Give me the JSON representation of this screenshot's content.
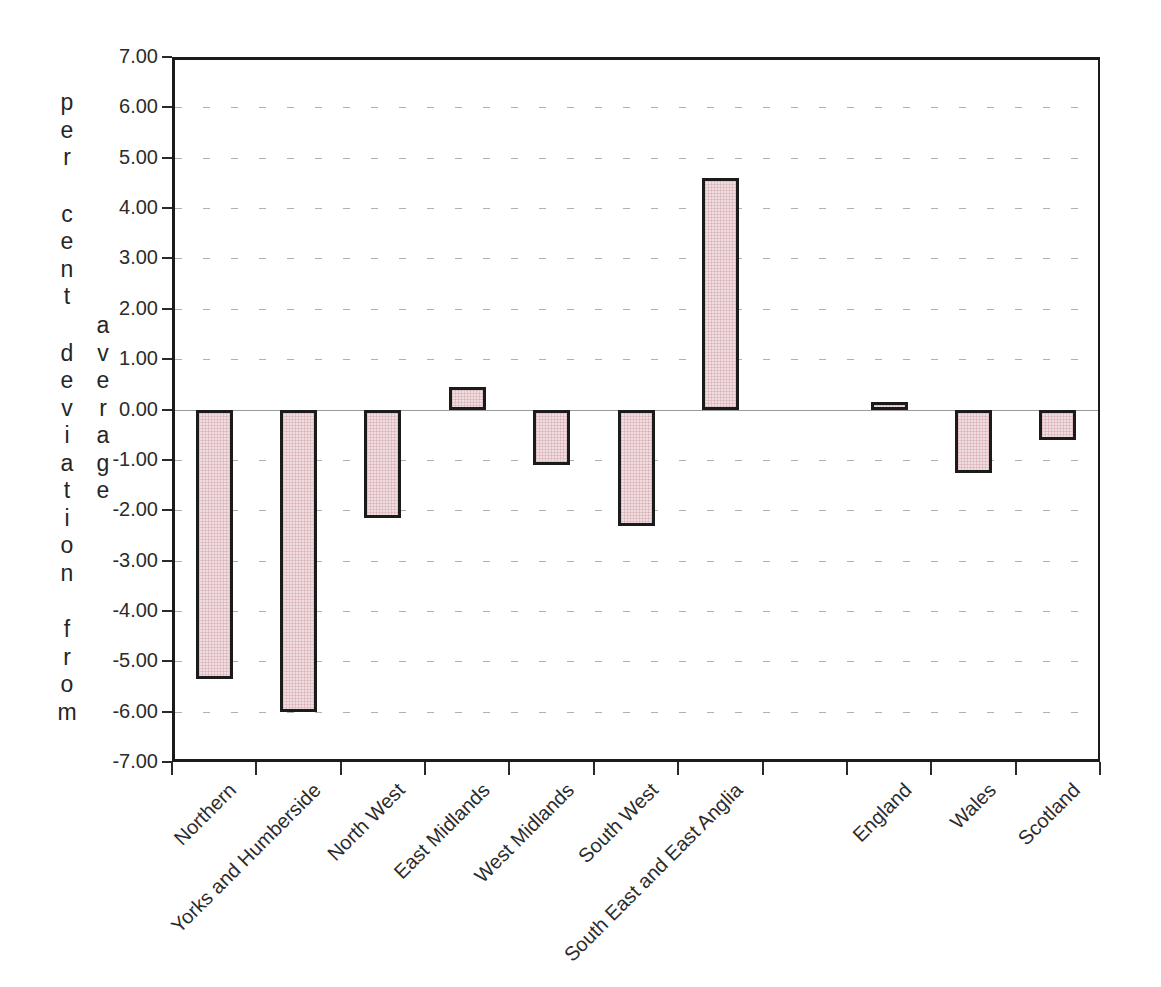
{
  "chart_data": {
    "type": "bar",
    "title": "",
    "y_axis_title": "per cent deviation from",
    "y_axis_title_2": "average",
    "categories": [
      "Northern",
      "Yorks and Humberside",
      "North West",
      "East Midlands",
      "West Midlands",
      "South West",
      "South East and East Anglia",
      "",
      "England",
      "Wales",
      "Scotland"
    ],
    "values": [
      -5.35,
      -6.0,
      -2.15,
      0.45,
      -1.1,
      -2.3,
      4.6,
      null,
      0.15,
      -1.25,
      -0.6
    ],
    "ylim": [
      -7,
      7
    ],
    "ytick_step": 1,
    "ytick_labels": [
      "7.00",
      "6.00",
      "5.00",
      "4.00",
      "3.00",
      "2.00",
      "1.00",
      "0.00",
      "-1.00",
      "-2.00",
      "-3.00",
      "-4.00",
      "-5.00",
      "-6.00",
      "-7.00"
    ],
    "grid": "horizontal-dashed",
    "legend": "none",
    "colors": {
      "bar_fill": "#f0dddf",
      "bar_texture_line": "rgba(201,148,156,0.35)",
      "bar_border": "#1b1b1b",
      "frame": "#1b1b1b",
      "gridline": "#b0b0b0",
      "zero_line": "#9a9a9a",
      "text": "#2b2b2b",
      "background": "#ffffff"
    }
  }
}
